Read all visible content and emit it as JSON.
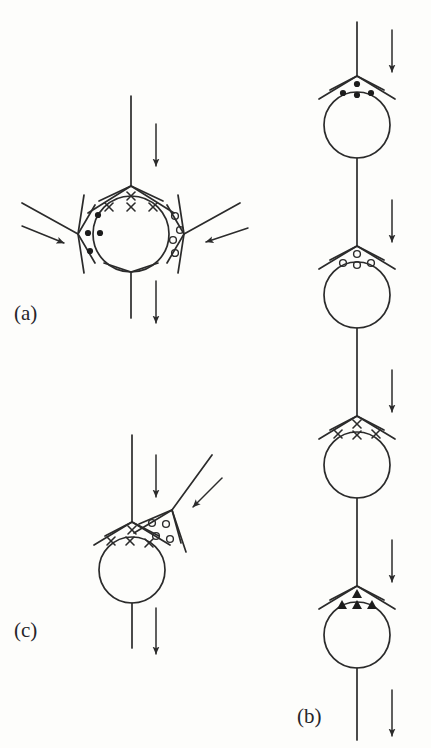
{
  "figure": {
    "kind": "line-diagram",
    "background_color": "#fdfdfb",
    "stroke_color": "#2b2b2b",
    "marker_color": "#1c1c1c",
    "panels": [
      {
        "id": "a",
        "label": "(a)",
        "label_x": 14,
        "label_y": 320,
        "node": {
          "cx": 131,
          "cy": 234,
          "r": 38
        },
        "channels": [
          {
            "name": "top-channel",
            "x1": 131,
            "y1": 96,
            "x2": 131,
            "y2": 186
          },
          {
            "name": "left-channel",
            "x1": 22,
            "y1": 203,
            "x2": 78,
            "y2": 234
          },
          {
            "name": "right-channel",
            "x1": 240,
            "y1": 203,
            "x2": 184,
            "y2": 234
          },
          {
            "name": "bottom-channel",
            "x1": 131,
            "y1": 272,
            "x2": 131,
            "y2": 318
          }
        ],
        "wedges": [
          {
            "name": "top-wedge",
            "marker": "cross",
            "count": 4,
            "orientation": "up"
          },
          {
            "name": "left-wedge",
            "marker": "dot",
            "count": 4,
            "orientation": "left"
          },
          {
            "name": "right-wedge",
            "marker": "circle",
            "count": 4,
            "orientation": "right"
          },
          {
            "name": "bottom-wedge",
            "marker": "none",
            "count": 0,
            "orientation": "down"
          }
        ],
        "arrows": [
          {
            "name": "top-flow-arrow",
            "direction": "down",
            "x1": 156,
            "y1": 124,
            "x2": 156,
            "y2": 166
          },
          {
            "name": "left-flow-arrow",
            "direction": "down-right",
            "x1": 22,
            "y1": 226,
            "x2": 64,
            "y2": 243
          },
          {
            "name": "right-flow-arrow",
            "direction": "down-left",
            "x1": 248,
            "y1": 228,
            "x2": 206,
            "y2": 242
          },
          {
            "name": "bottom-flow-arrow",
            "direction": "down",
            "x1": 156,
            "y1": 281,
            "x2": 156,
            "y2": 323
          }
        ]
      },
      {
        "id": "b",
        "label": "(b)",
        "label_x": 297,
        "label_y": 723,
        "axis_x": 357,
        "arrow_x": 392,
        "units": [
          {
            "name": "unit-1",
            "marker": "dot",
            "count": 4,
            "node_cy": 125,
            "wedge_apex_y": 76,
            "inlet_y": 22,
            "arrow_y1": 30,
            "arrow_y2": 72
          },
          {
            "name": "unit-2",
            "marker": "circle",
            "count": 4,
            "node_cy": 295,
            "wedge_apex_y": 246,
            "inlet_y": 192,
            "arrow_y1": 200,
            "arrow_y2": 242
          },
          {
            "name": "unit-3",
            "marker": "cross",
            "count": 4,
            "node_cy": 465,
            "wedge_apex_y": 416,
            "inlet_y": 362,
            "arrow_y1": 370,
            "arrow_y2": 412
          },
          {
            "name": "unit-4",
            "marker": "triangle",
            "count": 4,
            "node_cy": 635,
            "wedge_apex_y": 586,
            "inlet_y": 532,
            "arrow_y1": 540,
            "arrow_y2": 582
          }
        ],
        "node_radius": 33,
        "outlet": {
          "name": "outlet-channel",
          "y1": 668,
          "y2": 740
        },
        "outlet_arrow": {
          "name": "outlet-flow-arrow",
          "direction": "down",
          "y1": 690,
          "y2": 736
        }
      },
      {
        "id": "c",
        "label": "(c)",
        "label_x": 14,
        "label_y": 637,
        "node": {
          "cx": 132,
          "cy": 570,
          "r": 33
        },
        "channels": [
          {
            "name": "top-channel",
            "x1": 132,
            "y1": 435,
            "x2": 132,
            "y2": 522
          },
          {
            "name": "branch-channel",
            "x1": 212,
            "y1": 455,
            "x2": 172,
            "y2": 510
          },
          {
            "name": "bottom-channel",
            "x1": 132,
            "y1": 603,
            "x2": 132,
            "y2": 648
          }
        ],
        "wedges": [
          {
            "name": "top-wedge",
            "marker": "cross",
            "count": 4,
            "orientation": "up"
          },
          {
            "name": "branch-wedge",
            "marker": "circle",
            "count": 4,
            "orientation": "upper-right"
          }
        ],
        "arrows": [
          {
            "name": "top-flow-arrow",
            "direction": "down",
            "x1": 156,
            "y1": 455,
            "x2": 156,
            "y2": 497
          },
          {
            "name": "branch-flow-arrow",
            "direction": "down-left",
            "x1": 222,
            "y1": 478,
            "x2": 193,
            "y2": 507
          },
          {
            "name": "bottom-flow-arrow",
            "direction": "down",
            "x1": 156,
            "y1": 608,
            "x2": 156,
            "y2": 654
          }
        ]
      }
    ]
  }
}
